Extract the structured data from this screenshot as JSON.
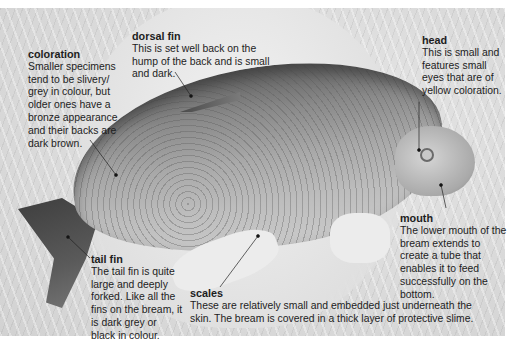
{
  "figure": {
    "palette": {
      "text": "#1d1d1d",
      "background": "#ffffff",
      "photo_tone": "grayscale"
    }
  },
  "labels": {
    "coloration": {
      "title": "coloration",
      "text": "Smaller specimens tend to be slivery/ grey in colour, but older ones have a bronze appearance and their backs are dark brown."
    },
    "dorsal_fin": {
      "title": "dorsal fin",
      "text": "This is set well back on the hump of the back and is small and dark."
    },
    "head": {
      "title": "head",
      "text": "This is small and features small eyes that are of yellow coloration."
    },
    "mouth": {
      "title": "mouth",
      "text": "The lower mouth of the bream extends to create a tube that enables it to feed successfully on the bottom."
    },
    "tail_fin": {
      "title": "tail fin",
      "text": "The tail fin is quite large and deeply forked. Like all the fins on the bream, it is dark grey or black in colour."
    },
    "scales": {
      "title": "scales",
      "text": "These are relatively small and embedded just underneath the skin. The bream is covered in a thick layer of protective slime."
    }
  }
}
